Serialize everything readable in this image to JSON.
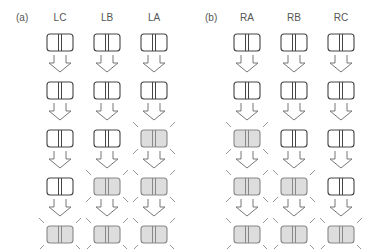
{
  "panels": [
    {
      "label": "(a)",
      "columns": [
        {
          "name": "LC",
          "highlighted_rows": [
            4
          ]
        },
        {
          "name": "LB",
          "highlighted_rows": [
            3,
            4
          ]
        },
        {
          "name": "LA",
          "highlighted_rows": [
            2,
            3,
            4
          ]
        }
      ]
    },
    {
      "label": "(b)",
      "columns": [
        {
          "name": "RA",
          "highlighted_rows": [
            2,
            3,
            4
          ]
        },
        {
          "name": "RB",
          "highlighted_rows": [
            3,
            4
          ]
        },
        {
          "name": "RC",
          "highlighted_rows": [
            4
          ]
        }
      ]
    }
  ],
  "rows": 5,
  "colors": {
    "stroke": "#444444",
    "highlight_fill": "#dddddd",
    "highlight_stroke": "#888888",
    "arrow": "#777777",
    "rays": "#999999"
  }
}
